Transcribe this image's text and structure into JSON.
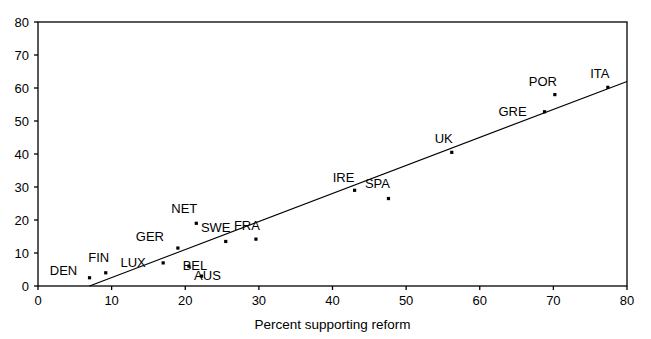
{
  "chart_data": {
    "type": "scatter",
    "title": "",
    "subtitle": "",
    "xlabel": "Percent supporting reform",
    "ylabel": "",
    "xlim": [
      0,
      80
    ],
    "ylim": [
      0,
      80
    ],
    "xticks": [
      0,
      10,
      20,
      30,
      40,
      50,
      60,
      70,
      80
    ],
    "yticks": [
      0,
      10,
      20,
      30,
      40,
      50,
      60,
      70,
      80
    ],
    "grid": false,
    "legend": null,
    "legend_position": "none",
    "frame": "box",
    "points": [
      {
        "label": "DEN",
        "x": 7.0,
        "y": 2.5,
        "label_dx": -26,
        "label_dy": -3
      },
      {
        "label": "FIN",
        "x": 9.2,
        "y": 4.0,
        "label_dx": -7,
        "label_dy": -11
      },
      {
        "label": "LUX",
        "x": 17.0,
        "y": 7.0,
        "label_dx": -30,
        "label_dy": 4
      },
      {
        "label": "GER",
        "x": 19.0,
        "y": 11.5,
        "label_dx": -28,
        "label_dy": -7
      },
      {
        "label": "BEL",
        "x": 20.5,
        "y": 6.0,
        "label_dx": 6,
        "label_dy": 4
      },
      {
        "label": "AUS",
        "x": 22.2,
        "y": 3.0,
        "label_dx": 6,
        "label_dy": 4
      },
      {
        "label": "NET",
        "x": 21.5,
        "y": 19.0,
        "label_dx": -12,
        "label_dy": -10
      },
      {
        "label": "SWE",
        "x": 25.5,
        "y": 13.5,
        "label_dx": -10,
        "label_dy": -9
      },
      {
        "label": "FRA",
        "x": 29.6,
        "y": 14.2,
        "label_dx": -9,
        "label_dy": -9
      },
      {
        "label": "IRE",
        "x": 43.0,
        "y": 29.0,
        "label_dx": -11,
        "label_dy": -8
      },
      {
        "label": "SPA",
        "x": 47.6,
        "y": 26.5,
        "label_dx": -11,
        "label_dy": -11
      },
      {
        "label": "UK",
        "x": 56.2,
        "y": 40.5,
        "label_dx": -8,
        "label_dy": -9
      },
      {
        "label": "GRE",
        "x": 68.8,
        "y": 52.8,
        "label_dx": -32,
        "label_dy": 4
      },
      {
        "label": "POR",
        "x": 70.2,
        "y": 58.0,
        "label_dx": -12,
        "label_dy": -9
      },
      {
        "label": "ITA",
        "x": 77.4,
        "y": 60.2,
        "label_dx": -8,
        "label_dy": -9
      }
    ],
    "trend_line": {
      "x_start": 7.0,
      "y_start": 0.0,
      "x_end": 80.0,
      "y_end": 62.0
    }
  }
}
